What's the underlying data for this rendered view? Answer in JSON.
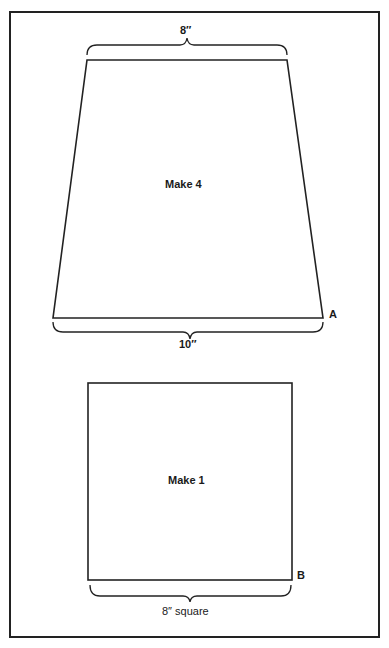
{
  "pattern_a": {
    "top_dimension": "8″",
    "bottom_dimension": "10″",
    "instruction": "Make 4",
    "piece_label": "A"
  },
  "pattern_b": {
    "instruction": "Make 1",
    "piece_label": "B",
    "bottom_dimension": "8″ square"
  },
  "colors": {
    "line": "#222222",
    "background": "#ffffff"
  }
}
